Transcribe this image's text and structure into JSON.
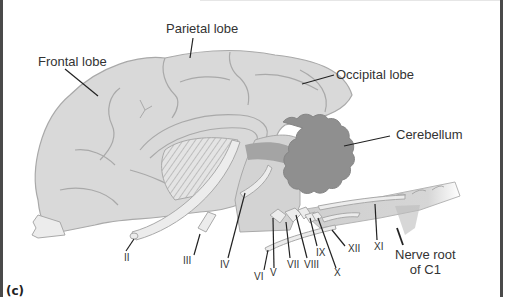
{
  "figure": {
    "panel_label": "(c)",
    "colors": {
      "cerebrum": "#d9d9d9",
      "cerebrum_outline": "#a9a9a9",
      "cerebellum": "#8f8f8f",
      "brainstem_dark": "#a4a4a4",
      "nerve": "#ececec",
      "leader_line": "#222222",
      "frame": "#4a4a4a"
    },
    "structures": [
      {
        "id": "frontal",
        "label": "Frontal lobe"
      },
      {
        "id": "parietal",
        "label": "Parietal lobe"
      },
      {
        "id": "occipital",
        "label": "Occipital lobe"
      },
      {
        "id": "cerebellum",
        "label": "Cerebellum"
      },
      {
        "id": "c1",
        "label_line1": "Nerve root",
        "label_line2": "of C1"
      }
    ],
    "cranial_nerves": [
      {
        "id": "II",
        "label": "II"
      },
      {
        "id": "III",
        "label": "III"
      },
      {
        "id": "IV",
        "label": "IV"
      },
      {
        "id": "V",
        "label": "V"
      },
      {
        "id": "VI",
        "label": "VI"
      },
      {
        "id": "VII",
        "label": "VII"
      },
      {
        "id": "VIII",
        "label": "VIII"
      },
      {
        "id": "IX",
        "label": "IX"
      },
      {
        "id": "X",
        "label": "X"
      },
      {
        "id": "XI",
        "label": "XI"
      },
      {
        "id": "XII",
        "label": "XII"
      }
    ]
  }
}
